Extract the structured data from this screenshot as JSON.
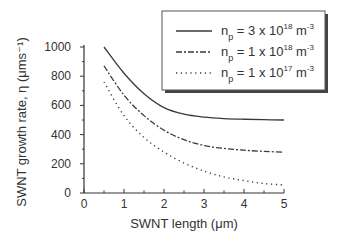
{
  "chart_data": {
    "type": "line",
    "title": "",
    "xlabel": "SWNT length (μm)",
    "ylabel": "SWNT growth rate, η (μms⁻¹)",
    "xlim": [
      0,
      5
    ],
    "ylim": [
      0,
      1000
    ],
    "xticks": [
      0,
      1,
      2,
      3,
      4,
      5
    ],
    "yticks": [
      0,
      200,
      400,
      600,
      800,
      1000
    ],
    "xtick_labels": [
      "0",
      "1",
      "2",
      "3",
      "4",
      "5"
    ],
    "ytick_labels": [
      "0",
      "200",
      "400",
      "600",
      "800",
      "1000"
    ],
    "grid": false,
    "legend_position": "upper right",
    "x": [
      0.5,
      1.0,
      1.5,
      2.0,
      2.5,
      3.0,
      3.5,
      4.0,
      4.5,
      5.0
    ],
    "series": [
      {
        "name": "n_p = 3 x 10^18 m^-3",
        "label_main": "n",
        "label_sub": "p",
        "label_mid": " = 3 x 10",
        "label_exp": "18",
        "label_unit": " m",
        "label_unit_exp": "-3",
        "style": "solid",
        "values": [
          1000,
          820,
          680,
          585,
          540,
          520,
          510,
          505,
          502,
          500
        ]
      },
      {
        "name": "n_p = 1 x 10^18 m^-3",
        "label_main": "n",
        "label_sub": "p",
        "label_mid": " = 1 x 10",
        "label_exp": "18",
        "label_unit": " m",
        "label_unit_exp": "-3",
        "style": "dashdot",
        "values": [
          870,
          670,
          530,
          430,
          365,
          325,
          305,
          293,
          285,
          280
        ]
      },
      {
        "name": "n_p = 1 x 10^17 m^-3",
        "label_main": "n",
        "label_sub": "p",
        "label_mid": " = 1 x 10",
        "label_exp": "17",
        "label_unit": " m",
        "label_unit_exp": "-3",
        "style": "dotted",
        "values": [
          760,
          530,
          380,
          280,
          205,
          150,
          110,
          85,
          65,
          55
        ]
      }
    ]
  }
}
